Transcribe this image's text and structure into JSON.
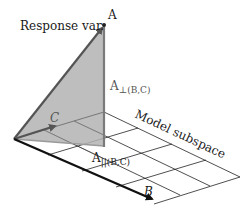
{
  "diagram": {
    "labels": {
      "response": "Response var.",
      "point_a": "A",
      "perp_main": "A",
      "perp_sub": "⊥(B,C)",
      "par_main": "A",
      "par_sub": "||(B,C)",
      "subspace": "Model subspace",
      "vec_b": "B",
      "vec_c": "C"
    },
    "colors": {
      "triangle_fill": "#b3b3b3",
      "triangle_edge": "#555555",
      "vertical": "#7a7a7a",
      "grid": "#222222",
      "vector_b": "#111111",
      "vector_c": "#555555"
    },
    "points": {
      "origin": [
        14,
        139
      ],
      "apex": [
        104,
        25
      ],
      "foot": [
        104,
        146
      ],
      "c_tip": [
        57,
        125
      ],
      "b_tip": [
        155,
        201
      ],
      "grid_back_left": [
        104,
        112
      ],
      "grid_back_right": [
        240,
        177
      ],
      "grid_front_right": [
        154,
        204
      ]
    }
  }
}
